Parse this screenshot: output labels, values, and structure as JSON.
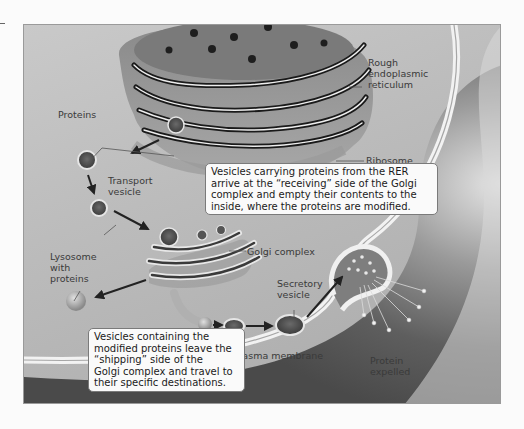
{
  "diagram": {
    "labels": {
      "rough_er_line1": "Rough",
      "rough_er_line2": "endoplasmic",
      "rough_er_line3": "reticulum",
      "proteins": "Proteins",
      "ribosome": "Ribosome",
      "transport_vesicle_line1": "Transport",
      "transport_vesicle_line2": "vesicle",
      "golgi_complex": "Golgi complex",
      "lysosome_line1": "Lysosome",
      "lysosome_line2": "with",
      "lysosome_line3": "proteins",
      "secretory_vesicle_line1": "Secretory",
      "secretory_vesicle_line2": "vesicle",
      "plasma_membrane": "Plasma membrane",
      "protein_expelled_line1": "Protein",
      "protein_expelled_line2": "expelled"
    },
    "callouts": {
      "receiving": {
        "line1": "Vesicles carrying proteins from the RER",
        "line2": "arrive at the “receiving” side of the Golgi",
        "line3": "complex and empty their contents to the",
        "line4": "inside, where the proteins are modified."
      },
      "shipping": {
        "line1": "Vesicles containing the",
        "line2": "modified proteins leave the",
        "line3": "“shipping” side of the",
        "line4": "Golgi complex and travel to",
        "line5": "their specific destinations."
      }
    },
    "colors": {
      "background": "#fbfbfb",
      "cytoplasm": "#bdbdbd",
      "membrane_highlight": "#e8e8e8",
      "outside_dark": "#5a5a5a",
      "callout_fill": "#fafafa",
      "text": "#3a3a3a"
    }
  }
}
